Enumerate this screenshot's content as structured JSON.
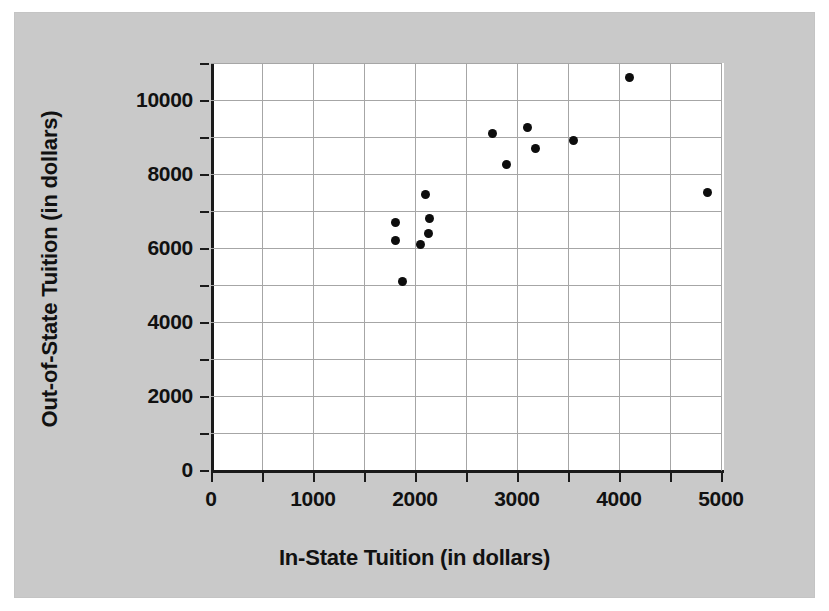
{
  "chart_data": {
    "type": "scatter",
    "title": "",
    "xlabel": "In-State Tuition (in dollars)",
    "ylabel": "Out-of-State Tuition (in dollars)",
    "xlim": [
      0,
      5000
    ],
    "ylim": [
      0,
      11000
    ],
    "x_major_ticks": [
      0,
      1000,
      2000,
      3000,
      4000,
      5000
    ],
    "x_minor_tick_interval": 500,
    "y_major_ticks": [
      0,
      2000,
      4000,
      6000,
      8000,
      10000
    ],
    "y_minor_tick_interval": 1000,
    "x_tick_labels": [
      "0",
      "1000",
      "2000",
      "3000",
      "4000",
      "5000"
    ],
    "y_tick_labels": [
      "0",
      "2000",
      "4000",
      "6000",
      "8000",
      "10000"
    ],
    "grid": true,
    "legend": null,
    "marker": "filled-circle",
    "marker_color": "#0d0d0d",
    "points": [
      {
        "x": 1810,
        "y": 6700
      },
      {
        "x": 1810,
        "y": 6200
      },
      {
        "x": 1880,
        "y": 5100
      },
      {
        "x": 2050,
        "y": 6100
      },
      {
        "x": 2100,
        "y": 7450
      },
      {
        "x": 2130,
        "y": 6400
      },
      {
        "x": 2140,
        "y": 6800
      },
      {
        "x": 2755,
        "y": 9100
      },
      {
        "x": 2900,
        "y": 8250
      },
      {
        "x": 3100,
        "y": 9250
      },
      {
        "x": 3180,
        "y": 8700
      },
      {
        "x": 3550,
        "y": 8900
      },
      {
        "x": 4100,
        "y": 10600
      },
      {
        "x": 4870,
        "y": 7500
      }
    ]
  },
  "figure": {
    "background_color": "#c9c9c9",
    "plot_background_color": "#ffffff",
    "axis_color": "#1a1a1a",
    "grid_color": "#a6a6a6"
  }
}
